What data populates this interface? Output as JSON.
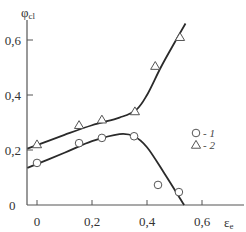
{
  "chart_data": {
    "type": "scatter",
    "title": "",
    "xlabel": "ε",
    "xlabel_sub": "e",
    "ylabel": "φ",
    "ylabel_sub": "cl",
    "xlim": [
      -0.035,
      0.75
    ],
    "ylim": [
      0,
      0.67
    ],
    "grid": false,
    "legend_position": "right-middle",
    "x_ticks": [
      0,
      0.2,
      0.4,
      0.6
    ],
    "x_tick_labels": [
      "0",
      "0,2",
      "0,4",
      "0,6"
    ],
    "y_ticks": [
      0,
      0.2,
      0.4,
      0.6
    ],
    "y_tick_labels": [
      "0",
      "0,2",
      "0,4",
      "0,6"
    ],
    "series": [
      {
        "name": "1",
        "marker": "circle",
        "points": [
          {
            "x": 0.0,
            "y": 0.153
          },
          {
            "x": 0.153,
            "y": 0.225
          },
          {
            "x": 0.236,
            "y": 0.244
          },
          {
            "x": 0.353,
            "y": 0.25
          },
          {
            "x": 0.44,
            "y": 0.073
          },
          {
            "x": 0.516,
            "y": 0.047
          }
        ],
        "curve": [
          {
            "x": -0.035,
            "y": 0.135
          },
          {
            "x": 0.1,
            "y": 0.19
          },
          {
            "x": 0.2,
            "y": 0.232
          },
          {
            "x": 0.3,
            "y": 0.258
          },
          {
            "x": 0.353,
            "y": 0.25
          },
          {
            "x": 0.4,
            "y": 0.21
          },
          {
            "x": 0.46,
            "y": 0.12
          },
          {
            "x": 0.535,
            "y": 0.0
          }
        ]
      },
      {
        "name": "2",
        "marker": "triangle",
        "points": [
          {
            "x": 0.0,
            "y": 0.22
          },
          {
            "x": 0.153,
            "y": 0.29
          },
          {
            "x": 0.236,
            "y": 0.31
          },
          {
            "x": 0.356,
            "y": 0.34
          },
          {
            "x": 0.43,
            "y": 0.505
          },
          {
            "x": 0.52,
            "y": 0.61
          }
        ],
        "curve": [
          {
            "x": -0.035,
            "y": 0.205
          },
          {
            "x": 0.1,
            "y": 0.255
          },
          {
            "x": 0.2,
            "y": 0.29
          },
          {
            "x": 0.3,
            "y": 0.318
          },
          {
            "x": 0.36,
            "y": 0.345
          },
          {
            "x": 0.4,
            "y": 0.4
          },
          {
            "x": 0.45,
            "y": 0.5
          },
          {
            "x": 0.5,
            "y": 0.59
          },
          {
            "x": 0.54,
            "y": 0.66
          }
        ]
      }
    ],
    "legend": [
      {
        "marker": "circle",
        "label": "- 1"
      },
      {
        "marker": "triangle",
        "label": "- 2"
      }
    ]
  },
  "colors": {
    "axis": "#555555",
    "line": "#2a2a2a",
    "marker_stroke": "#555555",
    "text": "#333333"
  }
}
